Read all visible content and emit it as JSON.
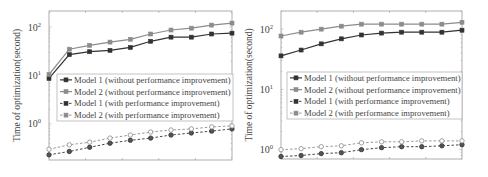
{
  "chart_data": [
    {
      "type": "line",
      "panel": "left",
      "title": "",
      "xlabel": "",
      "ylabel": "Time of optimization(second)",
      "yscale": "log",
      "ylim": [
        0.18,
        215
      ],
      "yticks": [
        {
          "value": 1,
          "label": "10",
          "exp": "0"
        },
        {
          "value": 10,
          "label": "10",
          "exp": "1"
        },
        {
          "value": 100,
          "label": "10",
          "exp": "2"
        }
      ],
      "x": [
        1,
        2,
        3,
        4,
        5,
        6,
        7,
        8,
        9,
        10
      ],
      "xtick_labels_visible": false,
      "grid": false,
      "legend_position": "center",
      "series": [
        {
          "name": "Model 1 (without performance improvement)",
          "color": "#333333",
          "dash": "solid",
          "marker": "square",
          "values": [
            8.7,
            27,
            31,
            33,
            38,
            51,
            62,
            62,
            72,
            75
          ]
        },
        {
          "name": "Model 2 (without performance improvement)",
          "color": "#8c8c8c",
          "dash": "solid",
          "marker": "square",
          "values": [
            10.5,
            35,
            42,
            49,
            56,
            72,
            87,
            95,
            110,
            121
          ]
        },
        {
          "name": "Model 1 (with performance improvement)",
          "color": "#333333",
          "dash": "dashed",
          "marker": "circle",
          "values": [
            0.23,
            0.27,
            0.33,
            0.4,
            0.46,
            0.51,
            0.59,
            0.65,
            0.71,
            0.79
          ]
        },
        {
          "name": "Model 2 (with performance improvement)",
          "color": "#8c8c8c",
          "dash": "dashed",
          "marker": "circle",
          "values": [
            0.3,
            0.37,
            0.42,
            0.51,
            0.59,
            0.68,
            0.75,
            0.79,
            0.87,
            0.91
          ]
        }
      ]
    },
    {
      "type": "line",
      "panel": "right",
      "title": "",
      "xlabel": "",
      "ylabel": "Time of optimization(second)",
      "yscale": "log",
      "ylim": [
        0.7,
        200
      ],
      "yticks": [
        {
          "value": 1,
          "label": "10",
          "exp": "0"
        },
        {
          "value": 10,
          "label": "10",
          "exp": "1"
        },
        {
          "value": 100,
          "label": "10",
          "exp": "2"
        }
      ],
      "x": [
        1,
        2,
        3,
        4,
        5,
        6,
        7,
        8,
        9,
        10
      ],
      "xtick_labels_visible": false,
      "grid": false,
      "legend_position": "center",
      "series": [
        {
          "name": "Model 1 (without performance improvement)",
          "color": "#333333",
          "dash": "solid",
          "marker": "square",
          "values": [
            36,
            45,
            57,
            69,
            80,
            86,
            89,
            89,
            89,
            96
          ]
        },
        {
          "name": "Model 2 (without performance improvement)",
          "color": "#8c8c8c",
          "dash": "solid",
          "marker": "square",
          "values": [
            77,
            89,
            100,
            112,
            121,
            121,
            121,
            121,
            121,
            130
          ]
        },
        {
          "name": "Model 1 (with performance improvement)",
          "color": "#333333",
          "dash": "dashed",
          "marker": "circle",
          "values": [
            0.77,
            0.8,
            0.86,
            0.89,
            1.0,
            1.08,
            1.12,
            1.12,
            1.16,
            1.21
          ]
        },
        {
          "name": "Model 2 (with performance improvement)",
          "color": "#8c8c8c",
          "dash": "dashed",
          "marker": "circle",
          "values": [
            1.0,
            1.04,
            1.12,
            1.16,
            1.3,
            1.35,
            1.35,
            1.4,
            1.4,
            1.4
          ]
        }
      ]
    }
  ],
  "layout": {
    "left": {
      "frame": [
        49,
        11,
        232,
        160
      ],
      "legend": [
        57,
        74,
        233,
        121
      ]
    },
    "right": {
      "frame": [
        281,
        11,
        462,
        159
      ],
      "legend": [
        287,
        72,
        462,
        119
      ]
    }
  }
}
